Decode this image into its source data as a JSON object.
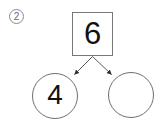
{
  "problem": {
    "number_label": "2",
    "number_marker_style": "circled",
    "type": "number-bond"
  },
  "diagram": {
    "whole": {
      "shape": "square",
      "value": "6",
      "filled": true
    },
    "parts": [
      {
        "shape": "circle",
        "position": "left",
        "value": "4",
        "filled": true
      },
      {
        "shape": "circle",
        "position": "right",
        "value": "",
        "filled": false
      }
    ],
    "connectors": [
      {
        "from": "whole",
        "to": "left-part",
        "arrowhead": true
      },
      {
        "from": "whole",
        "to": "right-part",
        "arrowhead": true
      }
    ]
  },
  "colors": {
    "background": "#ffffff",
    "box_border": "#777777",
    "circle_border": "#6f6f6f",
    "marker_border": "#8c8c8c",
    "marker_text": "#6e6e6e",
    "digit": "#111111",
    "connector": "#4a4a4a"
  }
}
